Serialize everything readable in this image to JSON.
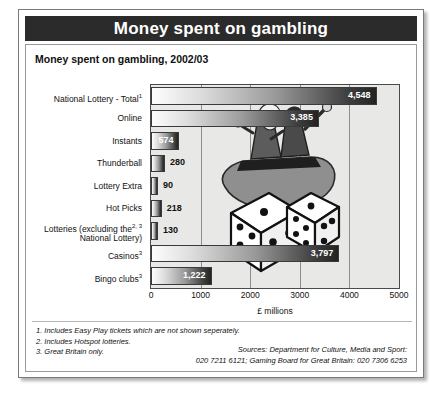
{
  "banner": {
    "title": "Money spent on gambling"
  },
  "chart_title": "Money spent on gambling, 2002/03",
  "axis": {
    "xlabel": "£ millions",
    "ticks": [
      "0",
      "1000",
      "2000",
      "3000",
      "4000",
      "5000"
    ]
  },
  "footnotes": [
    "1. Includes Easy Play tickets which are not shown seperately.",
    "2. Includes Hotspot lotteries.",
    "3. Great Britain only."
  ],
  "sources": [
    "Sources: Department for Culture, Media and Sport:",
    "020 7211 6121; Gaming Board for Great Britain: 020 7306 6253"
  ],
  "colors": {
    "banner_bg": "#2b2b2b",
    "plot_bg": "#e8e8e6",
    "bar_light": "#fdfdfd",
    "bar_dark": "#232323",
    "gridline": "#8d8d8d"
  },
  "chart_data": {
    "type": "bar",
    "orientation": "horizontal",
    "title": "Money spent on gambling, 2002/03",
    "xlabel": "£ millions",
    "ylabel": "",
    "xlim": [
      0,
      5000
    ],
    "xticks": [
      0,
      1000,
      2000,
      3000,
      4000,
      5000
    ],
    "grid": true,
    "legend": false,
    "categories": [
      "National Lottery - Total",
      "Online",
      "Instants",
      "Thunderball",
      "Lottery Extra",
      "Hot Picks",
      "Lotteries (excluding the National Lottery)",
      "Casinos",
      "Bingo clubs"
    ],
    "category_labels": [
      {
        "main": "National Lottery - Total",
        "sup": "1",
        "line2": ""
      },
      {
        "main": "Online",
        "sup": "",
        "line2": ""
      },
      {
        "main": "Instants",
        "sup": "",
        "line2": ""
      },
      {
        "main": "Thunderball",
        "sup": "",
        "line2": ""
      },
      {
        "main": "Lottery Extra",
        "sup": "",
        "line2": ""
      },
      {
        "main": "Hot Picks",
        "sup": "",
        "line2": ""
      },
      {
        "main": "Lotteries (excluding the",
        "sup": "2, 3",
        "line2": "National Lottery)"
      },
      {
        "main": "Casinos",
        "sup": "3",
        "line2": ""
      },
      {
        "main": "Bingo clubs",
        "sup": "3",
        "line2": ""
      }
    ],
    "values": [
      4548,
      3385,
      574,
      280,
      90,
      218,
      130,
      3797,
      1222
    ],
    "value_labels": [
      "4,548",
      "3,385",
      "574",
      "280",
      "90",
      "218",
      "130",
      "3,797",
      "1,222"
    ],
    "label_placement": [
      "inside",
      "inside",
      "inside",
      "outside",
      "outside",
      "outside",
      "outside",
      "inside",
      "inside"
    ]
  },
  "illustration": {
    "name": "gamblers-with-dice-illustration"
  }
}
